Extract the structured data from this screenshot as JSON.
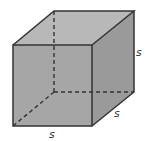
{
  "diagram": {
    "type": "cube",
    "colors": {
      "front_face": "#a6a6a6",
      "top_face": "#b8b8b8",
      "side_face": "#9a9a9a",
      "edge": "#333333",
      "background": "#ffffff"
    },
    "labels": {
      "right_edge": "s",
      "depth_edge": "s",
      "bottom_edge": "s"
    }
  }
}
